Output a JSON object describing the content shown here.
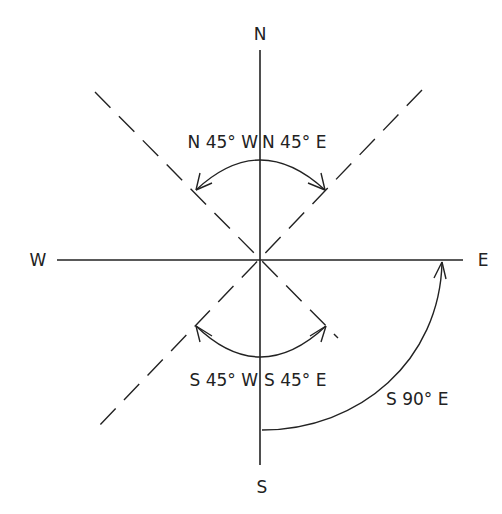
{
  "diagram": {
    "cardinals": {
      "north": "N",
      "south": "S",
      "east": "E",
      "west": "W"
    },
    "bearings": [
      {
        "id": "nw",
        "label": "N 45° W"
      },
      {
        "id": "ne",
        "label": "N 45° E"
      },
      {
        "id": "sw",
        "label": "S 45° W"
      },
      {
        "id": "se",
        "label": "S 45° E"
      },
      {
        "id": "s90e",
        "label": "S 90° E"
      }
    ],
    "colors": {
      "line": "#222222",
      "background": "#ffffff"
    }
  }
}
